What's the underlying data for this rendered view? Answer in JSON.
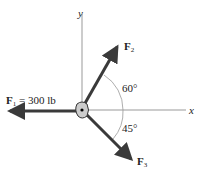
{
  "diagram": {
    "axes": {
      "x_label": "x",
      "y_label": "y"
    },
    "forces": [
      {
        "name": "F",
        "sub": "1",
        "value_text": " = 300 lb",
        "direction": "negative x"
      },
      {
        "name": "F",
        "sub": "2",
        "angle_label": "60°",
        "angle_from": "positive x, above"
      },
      {
        "name": "F",
        "sub": "3",
        "angle_label": "45°",
        "angle_from": "positive x, below"
      }
    ],
    "colors": {
      "arrow": "#3a3a3a",
      "axis": "#999999",
      "text": "#222222"
    }
  }
}
